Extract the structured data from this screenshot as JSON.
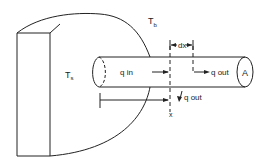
{
  "diagram": {
    "labels": {
      "surface_temp": "T",
      "surface_temp_sub": "s",
      "base_temp": "T",
      "base_temp_sub": "b",
      "dx": "dx",
      "q_in": "q  in",
      "q_out_axial": "q  out",
      "q_out_surface": "q  out",
      "area": "A",
      "x": "x"
    },
    "colors": {
      "stroke": "#222222",
      "background": "#ffffff"
    }
  }
}
